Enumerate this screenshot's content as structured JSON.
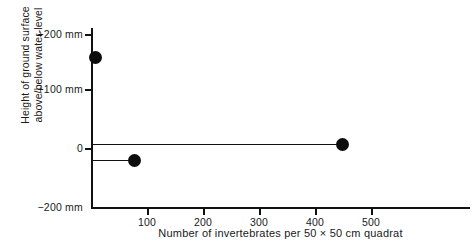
{
  "chart_data": {
    "type": "scatter",
    "title": "",
    "xlabel": "Number of invertebrates per 50 × 50 cm quadrat",
    "ylabel": "Height of ground surface\nabove/below water-level",
    "xlim": [
      0,
      560
    ],
    "ylim": [
      -200,
      230
    ],
    "grid": false,
    "legend": null,
    "xticks": [
      {
        "value": 100,
        "label": "100"
      },
      {
        "value": 200,
        "label": "200"
      },
      {
        "value": 300,
        "label": "300"
      },
      {
        "value": 400,
        "label": "400"
      },
      {
        "value": 500,
        "label": "500"
      }
    ],
    "yticks": [
      {
        "value": 200,
        "label": "+200 mm"
      },
      {
        "value": 100,
        "label": "+100 mm"
      },
      {
        "value": 0,
        "label": "0"
      },
      {
        "value": -200,
        "label": "−200 mm"
      }
    ],
    "points": [
      {
        "x": 6,
        "y": 160,
        "leader_to_axis": true
      },
      {
        "x": 447,
        "y": 8,
        "leader_to_axis": true
      },
      {
        "x": 76,
        "y": -20,
        "leader_to_axis": true
      },
      {
        "x": 30,
        "y": -185,
        "leader_to_axis": true
      }
    ],
    "marker": {
      "shape": "circle",
      "color": "#0d0d0d",
      "size_px": 13
    },
    "axis_color": "#111111"
  }
}
